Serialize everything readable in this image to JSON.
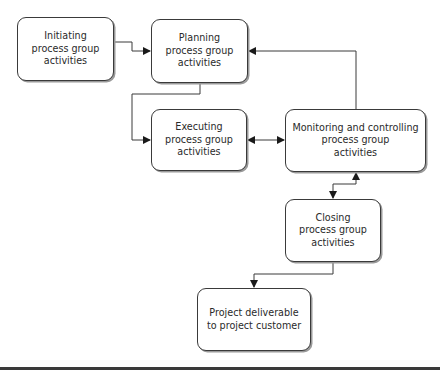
{
  "diagram": {
    "type": "flowchart",
    "nodes": [
      {
        "id": "initiating",
        "label": "Initiating\nprocess group\nactivities"
      },
      {
        "id": "planning",
        "label": "Planning\nprocess group\nactivities"
      },
      {
        "id": "executing",
        "label": "Executing\nprocess group\nactivities"
      },
      {
        "id": "monitoring",
        "label": "Monitoring  and controlling\nprocess group\nactivities"
      },
      {
        "id": "closing",
        "label": "Closing\nprocess group\nactivities"
      },
      {
        "id": "deliverable",
        "label": "Project deliverable\nto project customer"
      }
    ],
    "edges": [
      {
        "from": "initiating",
        "to": "planning",
        "direction": "forward"
      },
      {
        "from": "planning",
        "to": "executing",
        "direction": "forward"
      },
      {
        "from": "executing",
        "to": "monitoring",
        "direction": "bidirectional"
      },
      {
        "from": "monitoring",
        "to": "planning",
        "direction": "forward"
      },
      {
        "from": "monitoring",
        "to": "closing",
        "direction": "bidirectional"
      },
      {
        "from": "closing",
        "to": "deliverable",
        "direction": "forward"
      }
    ],
    "colors": {
      "stroke": "#3a3a3a",
      "shadow": "#9a9a9a",
      "background": "#ffffff",
      "text": "#2a2a2a"
    }
  }
}
